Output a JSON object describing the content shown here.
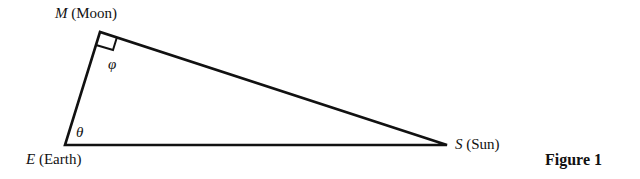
{
  "diagram": {
    "vertices": [
      {
        "id": "M",
        "symbol": "M",
        "name": "(Moon)"
      },
      {
        "id": "E",
        "symbol": "E",
        "name": "(Earth)"
      },
      {
        "id": "S",
        "symbol": "S",
        "name": "(Sun)"
      }
    ],
    "angles": {
      "at_M": "φ",
      "at_E": "θ"
    },
    "right_angle_at": "M",
    "caption": "Figure 1"
  }
}
